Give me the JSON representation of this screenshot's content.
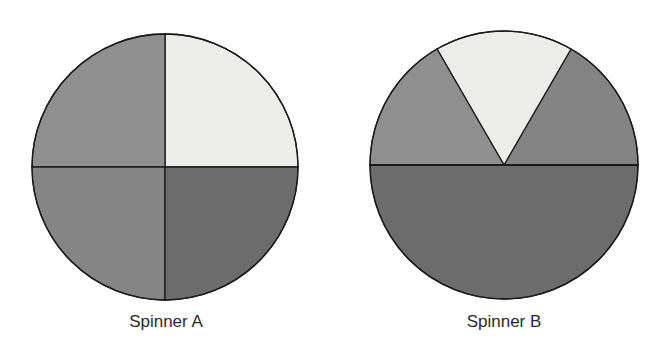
{
  "figure": {
    "spinners": [
      {
        "id": "A",
        "label": "Spinner A",
        "sectors": [
          {
            "name": "top-right",
            "start_deg": 0,
            "end_deg": 90,
            "fraction": 0.25,
            "color": "#ececea"
          },
          {
            "name": "top-left",
            "start_deg": 90,
            "end_deg": 180,
            "fraction": 0.25,
            "color": "#8f8f8f"
          },
          {
            "name": "bottom-left",
            "start_deg": 180,
            "end_deg": 270,
            "fraction": 0.25,
            "color": "#858585"
          },
          {
            "name": "bottom-right",
            "start_deg": 270,
            "end_deg": 360,
            "fraction": 0.25,
            "color": "#6c6c6c"
          }
        ]
      },
      {
        "id": "B",
        "label": "Spinner B",
        "sectors": [
          {
            "name": "top-right",
            "start_deg": 0,
            "end_deg": 60,
            "fraction": 0.1667,
            "color": "#848484"
          },
          {
            "name": "top-middle",
            "start_deg": 60,
            "end_deg": 120,
            "fraction": 0.1667,
            "color": "#ececea"
          },
          {
            "name": "top-left",
            "start_deg": 120,
            "end_deg": 180,
            "fraction": 0.1667,
            "color": "#8f8f8f"
          },
          {
            "name": "bottom-half",
            "start_deg": 180,
            "end_deg": 360,
            "fraction": 0.5,
            "color": "#6c6c6c"
          }
        ]
      }
    ]
  }
}
